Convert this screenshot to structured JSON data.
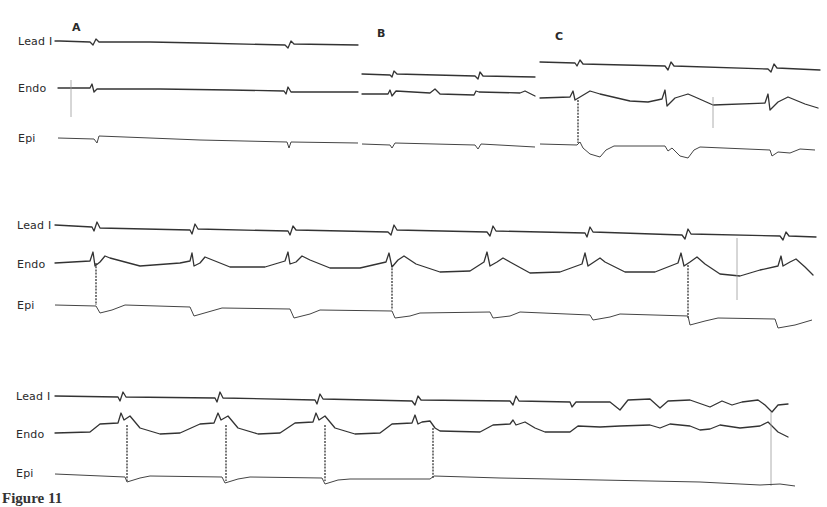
{
  "figure": {
    "panels": [
      {
        "id": "A",
        "label": "A"
      },
      {
        "id": "B",
        "label": "B"
      },
      {
        "id": "C",
        "label": "C"
      }
    ],
    "rows": [
      {
        "leads": [
          {
            "label": "Lead I"
          },
          {
            "label": "Endo"
          },
          {
            "label": "Epi"
          }
        ]
      },
      {
        "leads": [
          {
            "label": "Lead I"
          },
          {
            "label": "Endo"
          },
          {
            "label": "Epi"
          }
        ]
      },
      {
        "leads": [
          {
            "label": "Lead I"
          },
          {
            "label": "Endo"
          },
          {
            "label": "Epi"
          }
        ]
      }
    ],
    "caption": "Figure 11"
  },
  "style": {
    "trace_color": "#333333",
    "background": "#ffffff"
  }
}
